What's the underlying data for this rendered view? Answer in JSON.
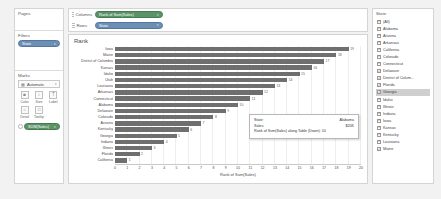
{
  "sidebar": {
    "pages": {
      "title": "Pages",
      "items": []
    },
    "filters": {
      "title": "Filters",
      "pills": [
        {
          "label": "State",
          "color": "blue",
          "caret": "▾",
          "icon": "filter-pill"
        }
      ]
    },
    "marks": {
      "title": "Marks",
      "mark_type": {
        "value": "Automatic",
        "icon": "bar-mark-icon",
        "caret": "▾"
      },
      "buttons": [
        {
          "label": "Color",
          "glyph": "■",
          "name": "color"
        },
        {
          "label": "Size",
          "glyph": "↕",
          "name": "size"
        },
        {
          "label": "Label",
          "glyph": "T",
          "name": "label"
        },
        {
          "label": "Detail",
          "glyph": "○",
          "name": "detail"
        },
        {
          "label": "Tooltip",
          "glyph": "□",
          "name": "tooltip"
        }
      ],
      "pills": [
        {
          "label": "SUM(Sales)",
          "color": "green",
          "caret": "▾"
        }
      ]
    }
  },
  "shelves": [
    {
      "name": "columns",
      "label": "Columns",
      "pill": {
        "label": "Rank of Sum(Sales)",
        "color": "green",
        "caret": "▾"
      }
    },
    {
      "name": "rows",
      "label": "Rows",
      "pill": {
        "label": "State",
        "color": "blue",
        "caret": "▾"
      }
    }
  ],
  "viz": {
    "title": "Rank"
  },
  "chart_data": {
    "type": "bar",
    "title": "Rank",
    "xlabel": "Rank of Sum(Sales)",
    "ylabel": "",
    "xlim": [
      0,
      20
    ],
    "xticks": [
      0,
      1,
      2,
      3,
      4,
      5,
      6,
      7,
      8,
      9,
      10,
      11,
      12,
      13,
      14,
      15,
      16,
      17,
      18,
      19,
      20
    ],
    "grid": true,
    "orientation": "horizontal",
    "categories": [
      "Iowa",
      "Maine",
      "District of Columbia",
      "Kansas",
      "Idaho",
      "Utah",
      "Louisiana",
      "Arkansas",
      "Connecticut",
      "Alabama",
      "Delaware",
      "Colorado",
      "Arizona",
      "Kentucky",
      "Georgia",
      "Indiana",
      "Illinois",
      "Florida",
      "California"
    ],
    "values": [
      19,
      18,
      17,
      16,
      15,
      14,
      13,
      12,
      11,
      10,
      9,
      8,
      7,
      6,
      5,
      4,
      3,
      2,
      1
    ],
    "bar_color": "#6f6f6f"
  },
  "tooltip": {
    "rows": [
      {
        "key": "State:",
        "value": "Alabama"
      },
      {
        "key": "Sales:",
        "value": "$20K"
      }
    ],
    "measure_line": "Rank of Sum(Sales) along Table (Down): 10"
  },
  "filter_panel": {
    "title": "State",
    "items": [
      {
        "label": "(All)",
        "checked": true,
        "selected": false
      },
      {
        "label": "Alabama",
        "checked": true,
        "selected": false
      },
      {
        "label": "Arizona",
        "checked": true,
        "selected": false
      },
      {
        "label": "Arkansas",
        "checked": true,
        "selected": false
      },
      {
        "label": "California",
        "checked": true,
        "selected": false
      },
      {
        "label": "Colorado",
        "checked": true,
        "selected": false
      },
      {
        "label": "Connecticut",
        "checked": true,
        "selected": false
      },
      {
        "label": "Delaware",
        "checked": true,
        "selected": false
      },
      {
        "label": "District of Colum...",
        "checked": true,
        "selected": false
      },
      {
        "label": "Florida",
        "checked": true,
        "selected": false
      },
      {
        "label": "Georgia",
        "checked": true,
        "selected": true
      },
      {
        "label": "Idaho",
        "checked": true,
        "selected": false
      },
      {
        "label": "Illinois",
        "checked": true,
        "selected": false
      },
      {
        "label": "Indiana",
        "checked": true,
        "selected": false
      },
      {
        "label": "Iowa",
        "checked": true,
        "selected": false
      },
      {
        "label": "Kansas",
        "checked": true,
        "selected": false
      },
      {
        "label": "Kentucky",
        "checked": true,
        "selected": false
      },
      {
        "label": "Louisiana",
        "checked": true,
        "selected": false
      },
      {
        "label": "Maine",
        "checked": true,
        "selected": false
      }
    ]
  }
}
